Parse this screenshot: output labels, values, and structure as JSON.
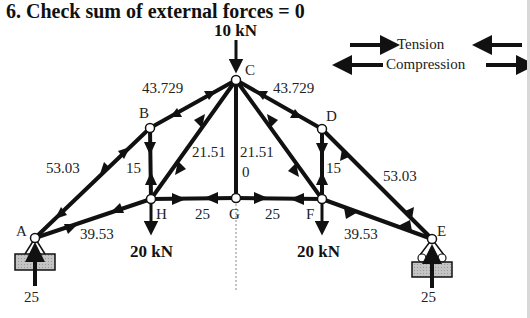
{
  "title": "6. Check sum of external forces = 0",
  "legend": {
    "tension": "Tension",
    "compression": "Compression"
  },
  "nodes": {
    "A": {
      "label": "A",
      "x": 35,
      "y": 238
    },
    "B": {
      "label": "B",
      "x": 150,
      "y": 128
    },
    "C": {
      "label": "C",
      "x": 236,
      "y": 80
    },
    "D": {
      "label": "D",
      "x": 322,
      "y": 129
    },
    "E": {
      "label": "E",
      "x": 432,
      "y": 239
    },
    "F": {
      "label": "F",
      "x": 322,
      "y": 199
    },
    "G": {
      "label": "G",
      "x": 236,
      "y": 198
    },
    "H": {
      "label": "H",
      "x": 151,
      "y": 199
    }
  },
  "members": [
    {
      "id": "AB",
      "force": "53.03",
      "type": "compression"
    },
    {
      "id": "BC",
      "force": "43.729",
      "type": "compression"
    },
    {
      "id": "CD",
      "force": "43.729",
      "type": "compression"
    },
    {
      "id": "DE",
      "force": "53.03",
      "type": "compression"
    },
    {
      "id": "AH",
      "force": "39.53",
      "type": "tension"
    },
    {
      "id": "HG",
      "force": "25",
      "type": "tension"
    },
    {
      "id": "GF",
      "force": "25",
      "type": "tension"
    },
    {
      "id": "FE",
      "force": "39.53",
      "type": "tension"
    },
    {
      "id": "BH",
      "force": "15",
      "type": "compression"
    },
    {
      "id": "DF",
      "force": "15",
      "type": "compression"
    },
    {
      "id": "CH",
      "force": "21.51",
      "type": "tension"
    },
    {
      "id": "CF",
      "force": "21.51",
      "type": "tension"
    },
    {
      "id": "CG",
      "force": "0",
      "type": "zero"
    }
  ],
  "loads": {
    "C": "10 kN",
    "H": "20 kN",
    "F": "20 kN"
  },
  "reactions": {
    "A": "25",
    "E": "25"
  },
  "colors": {
    "member": "#111111",
    "support_fill": "#b8b8b8",
    "text": "#222222"
  }
}
